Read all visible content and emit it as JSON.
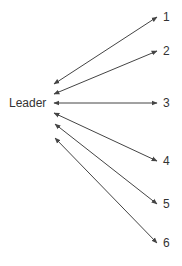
{
  "diagram": {
    "type": "star-communication-network",
    "center": {
      "label": "Leader"
    },
    "nodes": [
      {
        "id": "1",
        "label": "1"
      },
      {
        "id": "2",
        "label": "2"
      },
      {
        "id": "3",
        "label": "3"
      },
      {
        "id": "4",
        "label": "4"
      },
      {
        "id": "5",
        "label": "5"
      },
      {
        "id": "6",
        "label": "6"
      }
    ],
    "edges": [
      {
        "from": "Leader",
        "to": "1",
        "direction": "bidirectional"
      },
      {
        "from": "Leader",
        "to": "2",
        "direction": "bidirectional"
      },
      {
        "from": "Leader",
        "to": "3",
        "direction": "bidirectional"
      },
      {
        "from": "Leader",
        "to": "4",
        "direction": "bidirectional"
      },
      {
        "from": "Leader",
        "to": "5",
        "direction": "bidirectional"
      },
      {
        "from": "Leader",
        "to": "6",
        "direction": "bidirectional"
      }
    ],
    "colors": {
      "line": "#444444",
      "text": "#333333",
      "background": "#ffffff"
    }
  }
}
